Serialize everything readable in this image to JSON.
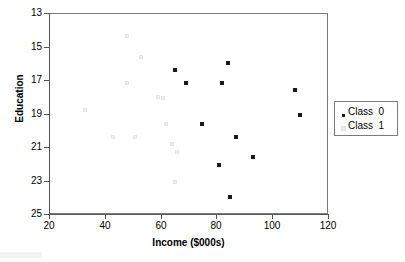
{
  "chart_data": {
    "type": "scatter",
    "title": "",
    "xlabel": "Income ($000s)",
    "ylabel": "Education",
    "xlim": [
      20,
      120
    ],
    "ylim": [
      13,
      25
    ],
    "xticks": [
      20,
      40,
      60,
      80,
      100,
      120
    ],
    "yticks": [
      13,
      15,
      17,
      19,
      21,
      23,
      25
    ],
    "grid": false,
    "legend_position": "right",
    "series": [
      {
        "name": "Class  0",
        "marker": "filled-square",
        "color": "#1a1a1a",
        "points": [
          [
            65,
            21.6
          ],
          [
            69,
            20.8
          ],
          [
            75,
            18.4
          ],
          [
            81,
            15.9
          ],
          [
            82,
            20.8
          ],
          [
            84,
            22.0
          ],
          [
            85,
            14.0
          ],
          [
            87,
            17.6
          ],
          [
            93,
            16.4
          ],
          [
            108,
            20.4
          ],
          [
            110,
            18.9
          ]
        ]
      },
      {
        "name": "Class  1",
        "marker": "light-square",
        "color": "#e8ebee",
        "points": [
          [
            33,
            19.2
          ],
          [
            43,
            17.6
          ],
          [
            48,
            23.6
          ],
          [
            48,
            20.8
          ],
          [
            51,
            17.6
          ],
          [
            53,
            22.4
          ],
          [
            59,
            20.0
          ],
          [
            61,
            19.9
          ],
          [
            62,
            18.4
          ],
          [
            64,
            17.2
          ],
          [
            65,
            14.9
          ],
          [
            66,
            16.7
          ]
        ]
      }
    ]
  },
  "axes": {
    "y_tick_labels": [
      "25",
      "23",
      "21",
      "19",
      "17",
      "15",
      "13"
    ],
    "x_tick_labels": [
      "20",
      "40",
      "60",
      "80",
      "100",
      "120"
    ],
    "ylabel": "Education",
    "xlabel": "Income ($000s)"
  },
  "legend": {
    "entries": [
      {
        "label": "Class  0",
        "marker": "class0-marker"
      },
      {
        "label": "Class  1",
        "marker": "class1-marker"
      }
    ]
  }
}
